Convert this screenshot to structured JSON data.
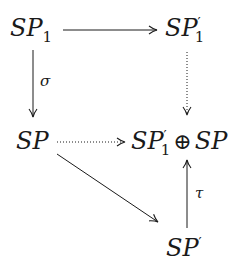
{
  "diagram": {
    "type": "commutative-diagram",
    "nodes": {
      "sp1": {
        "base": "SP",
        "sub": "1",
        "prime": false
      },
      "sp1prime": {
        "base": "SP",
        "sub": "1",
        "prime": true,
        "prime_mark": "′"
      },
      "sp": {
        "base": "SP"
      },
      "sum": {
        "left_base": "SP",
        "left_sub": "1",
        "prime_mark": "′",
        "operator": "⊕",
        "right_base": "SP"
      },
      "spprime": {
        "base": "SP",
        "prime_mark": "′"
      }
    },
    "edges": [
      {
        "from": "SP_1",
        "to": "SP'_1",
        "style": "solid",
        "label": ""
      },
      {
        "from": "SP_1",
        "to": "SP",
        "style": "solid",
        "label": "σ"
      },
      {
        "from": "SP'_1",
        "to": "SP'_1 ⊕ SP",
        "style": "dotted",
        "label": ""
      },
      {
        "from": "SP",
        "to": "SP'_1 ⊕ SP",
        "style": "dotted",
        "label": ""
      },
      {
        "from": "SP",
        "to": "SP'",
        "style": "solid",
        "label": ""
      },
      {
        "from": "SP'",
        "to": "SP'_1 ⊕ SP",
        "style": "solid",
        "label": "τ"
      }
    ],
    "labels": {
      "sigma": "σ",
      "tau": "τ"
    },
    "colors": {
      "ink": "#1a1a1a",
      "background": "#ffffff"
    }
  }
}
